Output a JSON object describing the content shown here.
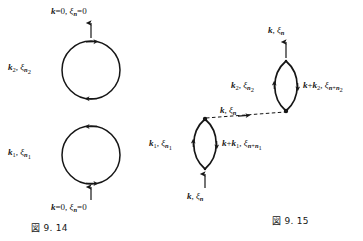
{
  "page": {
    "background_color": "#ffffff",
    "ink_color": "#161616",
    "width": 363,
    "height": 241
  },
  "figures": [
    {
      "id": "fig-9-14",
      "caption": "図 9. 14",
      "caption_number": "9. 14",
      "diagram_type": "feynman-loop-diagram",
      "loops": [
        {
          "id": "loop-upper",
          "shape": "circle",
          "side_label": "k₂, ξₙ₂",
          "side_label_parts": {
            "momentum": "k",
            "momentum_sub": "2",
            "energy": "ξ",
            "energy_sub": "n₂"
          },
          "external_label": "k = 0, ξₙ = 0",
          "external_label_parts": {
            "momentum": "k",
            "momentum_value": "0",
            "energy": "ξ",
            "energy_sub": "n",
            "energy_value": "0"
          },
          "external_arrow_direction": "up",
          "external_arrow_position": "top"
        },
        {
          "id": "loop-lower",
          "shape": "circle",
          "side_label": "k₁, ξₙ₁",
          "side_label_parts": {
            "momentum": "k",
            "momentum_sub": "1",
            "energy": "ξ",
            "energy_sub": "n₁"
          },
          "external_label": "k = 0, ξₙ = 0",
          "external_label_parts": {
            "momentum": "k",
            "momentum_value": "0",
            "energy": "ξ",
            "energy_sub": "n",
            "energy_value": "0"
          },
          "external_arrow_direction": "up",
          "external_arrow_position": "bottom"
        }
      ]
    },
    {
      "id": "fig-9-15",
      "caption": "図 9. 15",
      "caption_number": "9. 15",
      "diagram_type": "feynman-loop-diagram",
      "loops": [
        {
          "id": "loop-upper-right",
          "shape": "lens",
          "left_label": "k₂, ξₙ₂",
          "right_label": "k + k₂, ξₙ₊ₙ₂",
          "external_label": "k, ξₙ",
          "external_arrow_direction": "up",
          "external_arrow_position": "top"
        },
        {
          "id": "loop-lower-left",
          "shape": "lens",
          "left_label": "k₁, ξₙ₁",
          "right_label": "k + k₁, ξₙ₊ₙ₁",
          "external_label": "k, ξₙ",
          "external_arrow_direction": "up",
          "external_arrow_position": "bottom"
        }
      ],
      "connector": {
        "id": "interaction-line",
        "style": "dashed",
        "label": "k, ξₙ",
        "arrow_direction": "right"
      }
    }
  ],
  "labels": {
    "fig14_top_external": "k = 0, ξₙ = 0",
    "fig14_bottom_external": "k = 0, ξₙ = 0",
    "fig14_upper_side": "k₂, ξₙ₂",
    "fig14_lower_side": "k₁, ξₙ₁",
    "fig14_caption": "図 9. 14",
    "fig15_top_external": "k, ξₙ",
    "fig15_upper_left": "k₂, ξₙ₂",
    "fig15_upper_right": "k + k₂, ξₙ₊ₙ₂",
    "fig15_lower_left": "k₁, ξₙ₁",
    "fig15_lower_right": "k + k₁, ξₙ₊ₙ₁",
    "fig15_bottom_external": "k, ξₙ",
    "fig15_dashed": "k, ξₙ",
    "fig15_caption": "図 9. 15"
  }
}
